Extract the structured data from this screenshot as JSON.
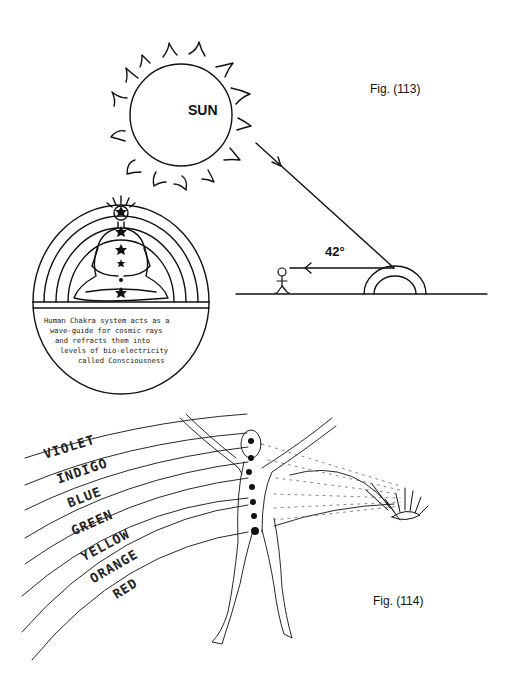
{
  "figure_113": {
    "caption": "Fig. (113)",
    "sun_label": "SUN",
    "angle_label": "42°",
    "chakra_caption_lines": [
      "Human Chakra system acts as a",
      "wave-guide for cosmic rays",
      "and refracts them into",
      "levels of bio-electricity",
      "called Consciousness"
    ]
  },
  "figure_114": {
    "caption": "Fig. (114)",
    "color_bands": [
      "VIOLET",
      "INDIGO",
      "BLUE",
      "GREEN",
      "YELLOW",
      "ORANGE",
      "RED"
    ]
  },
  "colors": {
    "ink": "#111111",
    "background": "#ffffff"
  }
}
